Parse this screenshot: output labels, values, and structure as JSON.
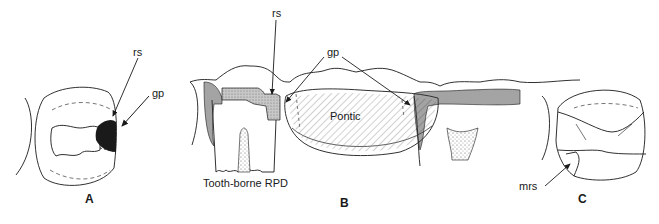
{
  "panels": {
    "a": {
      "letter": "A",
      "labels": {
        "rest_seat": "rs",
        "guide_plane": "gp"
      }
    },
    "b": {
      "letter": "B",
      "labels": {
        "rest_seat": "rs",
        "guide_plane": "gp",
        "pontic": "Pontic",
        "caption": "Tooth-borne RPD"
      }
    },
    "c": {
      "letter": "C",
      "labels": {
        "marginal_ridge_seat": "mrs"
      }
    }
  },
  "colors": {
    "line": "#1a1a1a",
    "filled_dark": "#1a1a1a",
    "stipple_gray": "#b8b8b8",
    "hatch": "#555555",
    "background": "#ffffff"
  }
}
